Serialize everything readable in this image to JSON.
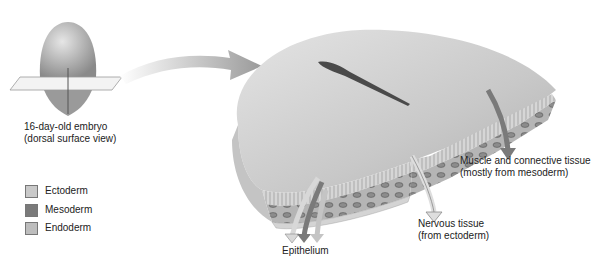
{
  "diagram": {
    "embryo_caption": {
      "line1": "16-day-old embryo",
      "line2": "(dorsal surface view)"
    },
    "legend": [
      {
        "label": "Ectoderm",
        "color": "#c9c9c9"
      },
      {
        "label": "Mesoderm",
        "color": "#7a7a7a"
      },
      {
        "label": "Endoderm",
        "color": "#bdbdbd"
      }
    ],
    "labels": {
      "muscle": {
        "line1": "Muscle and connective tissue",
        "line2": "(mostly from mesoderm)"
      },
      "nervous": {
        "line1": "Nervous tissue",
        "line2": "(from ectoderm)"
      },
      "epithelium": "Epithelium"
    }
  }
}
